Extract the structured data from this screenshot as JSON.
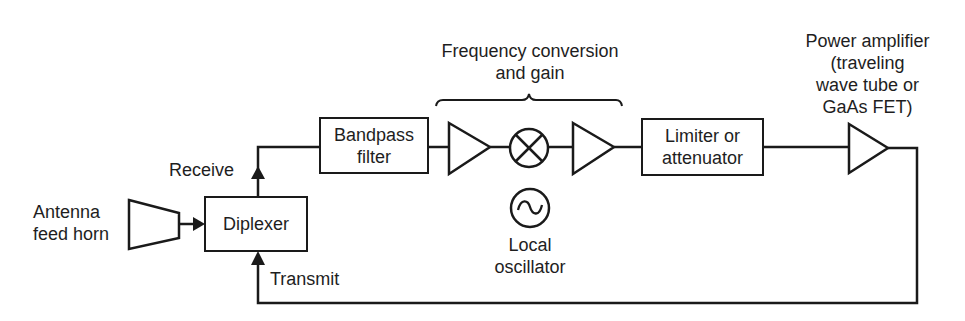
{
  "diagram": {
    "type": "block-diagram",
    "stroke_color": "#1a1a1a",
    "labels": {
      "freq_conversion": [
        "Frequency conversion",
        "and gain"
      ],
      "power_amplifier": [
        "Power amplifier",
        "(traveling",
        "wave tube or",
        "GaAs FET)"
      ],
      "antenna": [
        "Antenna",
        "feed horn"
      ],
      "receive": "Receive",
      "transmit": "Transmit",
      "local_oscillator": [
        "Local",
        "oscillator"
      ]
    },
    "blocks": {
      "diplexer": "Diplexer",
      "bandpass": [
        "Bandpass",
        "filter"
      ],
      "limiter": [
        "Limiter or",
        "attenuator"
      ]
    },
    "components": [
      {
        "id": "antenna-feed-horn",
        "shape": "horn"
      },
      {
        "id": "diplexer",
        "shape": "box"
      },
      {
        "id": "bandpass-filter",
        "shape": "box"
      },
      {
        "id": "amplifier-1",
        "shape": "triangle"
      },
      {
        "id": "mixer",
        "shape": "circle-x"
      },
      {
        "id": "amplifier-2",
        "shape": "triangle"
      },
      {
        "id": "local-oscillator",
        "shape": "circle-sine"
      },
      {
        "id": "limiter-attenuator",
        "shape": "box"
      },
      {
        "id": "power-amplifier",
        "shape": "triangle"
      }
    ],
    "connections": [
      {
        "from": "antenna-feed-horn",
        "to": "diplexer"
      },
      {
        "from": "diplexer",
        "to": "bandpass-filter",
        "label": "Receive"
      },
      {
        "from": "bandpass-filter",
        "to": "amplifier-1"
      },
      {
        "from": "amplifier-1",
        "to": "mixer"
      },
      {
        "from": "mixer",
        "to": "amplifier-2"
      },
      {
        "from": "amplifier-2",
        "to": "limiter-attenuator"
      },
      {
        "from": "limiter-attenuator",
        "to": "power-amplifier"
      },
      {
        "from": "power-amplifier",
        "to": "diplexer",
        "label": "Transmit"
      }
    ]
  }
}
